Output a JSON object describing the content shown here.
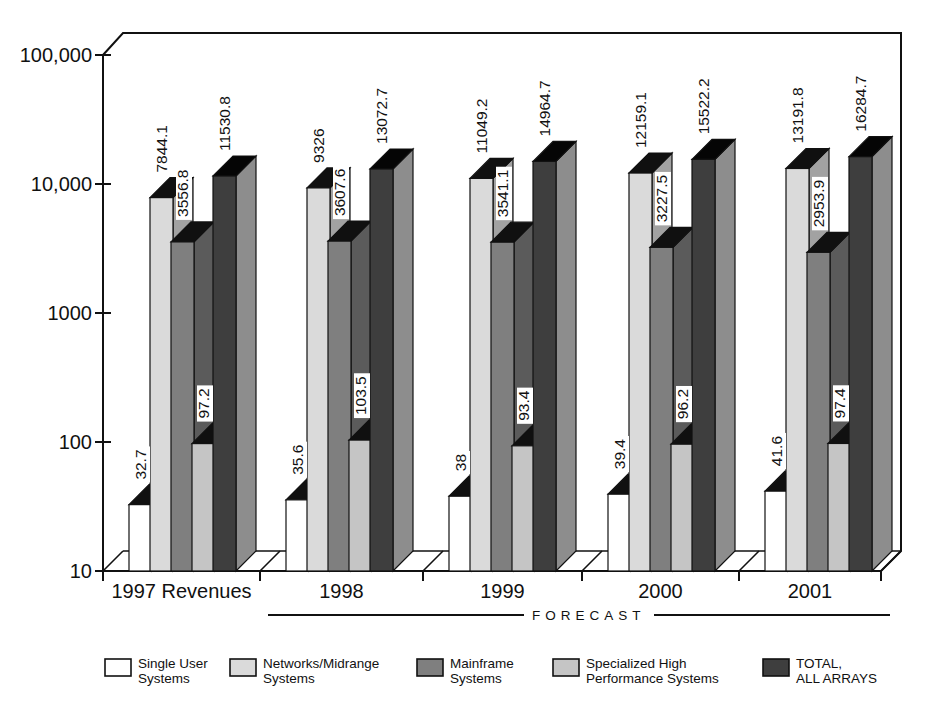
{
  "page": {
    "background": "#ffffff",
    "ink": "#111111"
  },
  "chart_data": {
    "type": "bar",
    "projection": "3d-extruded",
    "title": "",
    "y_axis": {
      "scale": "log",
      "range": [
        10,
        100000
      ],
      "tick_labels": [
        "100,000",
        "10,000",
        "1000",
        "100",
        "10"
      ],
      "tick_values": [
        100000,
        10000,
        1000,
        100,
        10
      ]
    },
    "x_axis": {
      "categories": [
        "1997 Revenues",
        "1998",
        "1999",
        "2000",
        "2001"
      ],
      "forecast_label": "FORECAST",
      "forecast_span": [
        "1998",
        "2001"
      ]
    },
    "grid": false,
    "legend_position": "bottom",
    "series": [
      {
        "name": "Single User Systems",
        "legend_lines": [
          "Single User",
          "Systems"
        ],
        "front_color": "#ffffff",
        "side_color": "#d2d2d2",
        "top_color": "#101010",
        "values": [
          32.7,
          35.6,
          38,
          39.4,
          41.6
        ],
        "value_labels": [
          "32.7",
          "35.6",
          "38",
          "39.4",
          "41.6"
        ]
      },
      {
        "name": "Networks/Midrange Systems",
        "legend_lines": [
          "Networks/Midrange",
          "Systems"
        ],
        "front_color": "#dadada",
        "side_color": "#a2a2a2",
        "top_color": "#101010",
        "values": [
          7844.1,
          9326,
          11049.2,
          12159.1,
          13191.8
        ],
        "value_labels": [
          "7844.1",
          "9326",
          "11049.2",
          "12159.1",
          "13191.8"
        ]
      },
      {
        "name": "Mainframe Systems",
        "legend_lines": [
          "Mainframe",
          "Systems"
        ],
        "front_color": "#7f7f7f",
        "side_color": "#5b5b5b",
        "top_color": "#101010",
        "values": [
          3556.8,
          3607.6,
          3541.1,
          3227.5,
          2953.9
        ],
        "value_labels": [
          "3556.8",
          "3607.6",
          "3541.1",
          "3227.5",
          "2953.9"
        ]
      },
      {
        "name": "Specialized High Performance Systems",
        "legend_lines": [
          "Specialized High",
          "Performance Systems"
        ],
        "front_color": "#c5c5c5",
        "side_color": "#8f8f8f",
        "top_color": "#101010",
        "values": [
          97.2,
          103.5,
          93.4,
          96.2,
          97.4
        ],
        "value_labels": [
          "97.2",
          "103.5",
          "93.4",
          "96.2",
          "97.4"
        ]
      },
      {
        "name": "TOTAL, ALL ARRAYS",
        "legend_lines": [
          "TOTAL,",
          "ALL ARRAYS"
        ],
        "front_color": "#3e3e3e",
        "side_color": "#8d8d8d",
        "top_color": "#050505",
        "values": [
          11530.8,
          13072.7,
          14964.7,
          15522.2,
          16284.7
        ],
        "value_labels": [
          "11530.8",
          "13072.7",
          "14964.7",
          "15522.2",
          "16284.7"
        ]
      }
    ]
  }
}
